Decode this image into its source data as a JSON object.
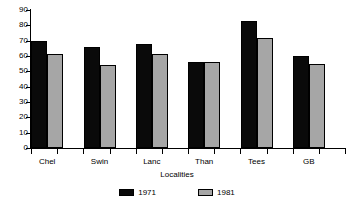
{
  "chart_data": {
    "type": "bar",
    "title": "",
    "xlabel": "Localities",
    "ylabel": "",
    "categories": [
      "Chel",
      "Swin",
      "Lanc",
      "Than",
      "Tees",
      "GB"
    ],
    "series": [
      {
        "name": "1971",
        "color": "#0a0a0a",
        "values": [
          70,
          66,
          68,
          56,
          83,
          60
        ]
      },
      {
        "name": "1981",
        "color": "#a6a6a6",
        "values": [
          61,
          54,
          61,
          56,
          72,
          55
        ]
      }
    ],
    "ylim": [
      0,
      90
    ],
    "yticks": [
      0,
      10,
      20,
      30,
      40,
      50,
      60,
      70,
      80,
      90
    ],
    "ytick_labels": [
      "0",
      "10",
      "20",
      "30",
      "40",
      "50",
      "60",
      "70",
      "80",
      "90"
    ],
    "grid": false,
    "legend_position": "bottom",
    "legend_entries": [
      "1971",
      "1981"
    ]
  },
  "axes": {
    "x_title": "Localities"
  },
  "colors": {
    "series_1971": "#0a0a0a",
    "series_1981": "#a6a6a6",
    "axis": "#000000",
    "background": "#ffffff"
  }
}
